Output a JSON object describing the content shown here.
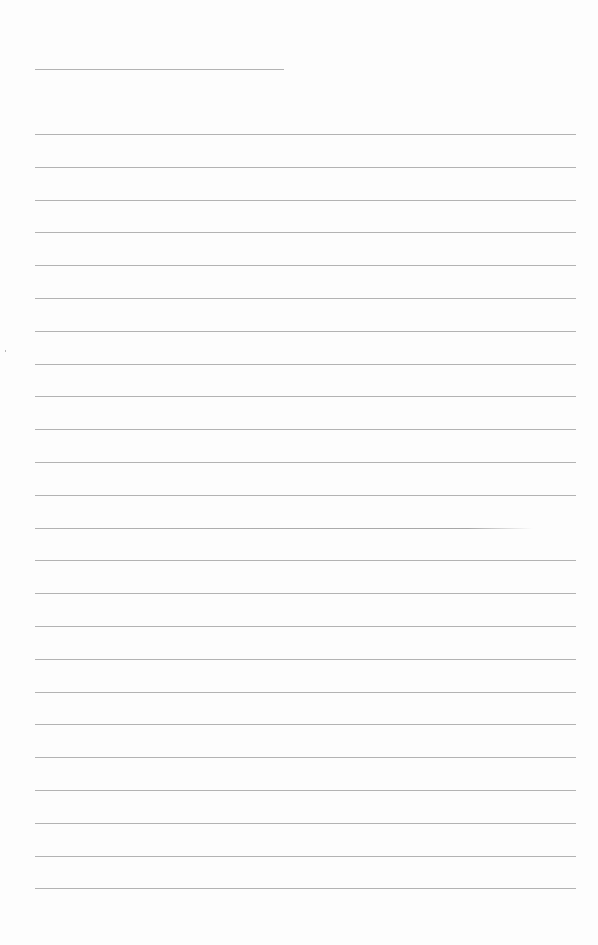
{
  "document": {
    "type": "blank lined paper",
    "header_line": {
      "present": true,
      "length": "short"
    },
    "ruled_line_count": 24,
    "line_spacing_px": 32.8,
    "line_color": "#9a9a9a",
    "background_color": "#ffffff",
    "text": ""
  }
}
